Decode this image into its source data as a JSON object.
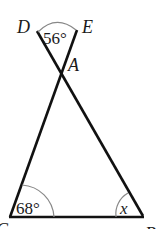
{
  "diagram": {
    "type": "geometry",
    "points": {
      "D": {
        "label": "D",
        "x": 37,
        "y": 30
      },
      "E": {
        "label": "E",
        "x": 77,
        "y": 29
      },
      "A": {
        "label": "A",
        "x": 61,
        "y": 68
      },
      "C": {
        "label": "C",
        "x": 10,
        "y": 217
      },
      "B": {
        "label": "B",
        "x": 143,
        "y": 216
      }
    },
    "segments": [
      {
        "from": "D",
        "to": "B"
      },
      {
        "from": "E",
        "to": "C"
      },
      {
        "from": "C",
        "to": "B"
      }
    ],
    "angles": {
      "DAE": {
        "label": "56°"
      },
      "C": {
        "label": "68°"
      },
      "B": {
        "label": "x"
      }
    },
    "colors": {
      "line": "#111111",
      "arc": "#888888",
      "text": "#1a1a1a",
      "background": "#ffffff"
    }
  }
}
